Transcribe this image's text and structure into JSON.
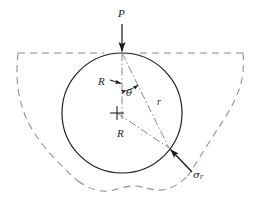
{
  "figure": {
    "background_color": "#ffffff",
    "ink_color": "#1a1a1a",
    "construction_color": "#808080",
    "boundary_color": "#8c8c8c"
  },
  "labels": {
    "load": "P",
    "radius_upper": "R",
    "radius_lower": "R",
    "polar_radius": "r",
    "angle": "θ",
    "stress_symbol": "σ",
    "stress_subscript": "r"
  },
  "geometry": {
    "circle": {
      "center_x": 122,
      "center_y": 113,
      "radius": 60,
      "line_style": "solid",
      "stroke_width": 1.1
    },
    "center_mark": {
      "x": 117,
      "y": 113,
      "size": 7,
      "style": "cross"
    },
    "surface_line": {
      "y": 53,
      "x_start": 18,
      "x_end": 243,
      "line_style": "dashed"
    },
    "load_arrow": {
      "x": 122,
      "y_start": 24,
      "y_end": 53,
      "direction": "down"
    },
    "vertical_axis": {
      "x": 122,
      "y_start": 53,
      "y_end": 120,
      "line_style": "dash-dot"
    },
    "polar_radius_line": {
      "x_start": 122,
      "y_start": 53,
      "x_end": 169,
      "y_end": 148,
      "line_style": "dash-dot"
    },
    "lower_radius_line": {
      "x_start": 117,
      "y_start": 113,
      "x_end": 169,
      "y_end": 148,
      "line_style": "dash-dot"
    },
    "angle_arc": {
      "center_x": 122,
      "center_y": 53,
      "radius": 38,
      "start_deg": 90,
      "end_deg": 63,
      "arrowheads": "both"
    },
    "radius_arrow_upper": {
      "x_start": 109,
      "y_start": 81,
      "x_end": 122,
      "y_end": 83,
      "direction": "right"
    },
    "stress_arrow": {
      "x_start": 192,
      "y_start": 172,
      "x_end": 169,
      "y_end": 148,
      "direction": "up-left"
    },
    "boundary": {
      "line_style": "dashed",
      "note": "irregular soil/body outline"
    }
  }
}
